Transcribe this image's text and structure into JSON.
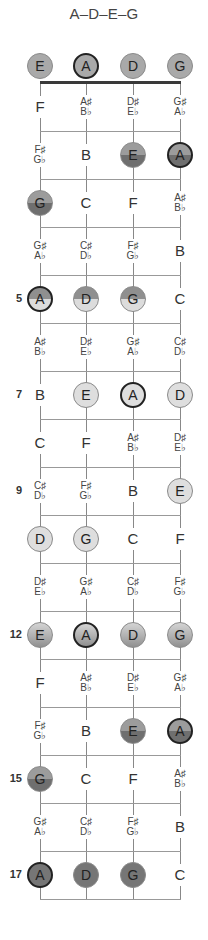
{
  "title": "A–D–E–G",
  "strings": [
    "E",
    "A",
    "D",
    "G"
  ],
  "fret_numbers": [
    {
      "fret": 5,
      "label": "5"
    },
    {
      "fret": 7,
      "label": "7"
    },
    {
      "fret": 9,
      "label": "9"
    },
    {
      "fret": 12,
      "label": "12"
    },
    {
      "fret": 15,
      "label": "15"
    },
    {
      "fret": 17,
      "label": "17"
    }
  ],
  "rows": [
    {
      "fret": 0,
      "cells": [
        {
          "n": "E",
          "s": "open"
        },
        {
          "n": "A",
          "s": "open",
          "root": true
        },
        {
          "n": "D",
          "s": "open"
        },
        {
          "n": "G",
          "s": "open"
        }
      ]
    },
    {
      "fret": 1,
      "cells": [
        {
          "n": "F"
        },
        {
          "n": "A♯|B♭"
        },
        {
          "n": "D♯|E♭"
        },
        {
          "n": "G♯|A♭"
        }
      ]
    },
    {
      "fret": 2,
      "cells": [
        {
          "n": "F♯|G♭"
        },
        {
          "n": "B"
        },
        {
          "n": "E",
          "s": "split-dark"
        },
        {
          "n": "A",
          "s": "split-dark",
          "root": true
        }
      ]
    },
    {
      "fret": 3,
      "cells": [
        {
          "n": "G",
          "s": "split-dark"
        },
        {
          "n": "C"
        },
        {
          "n": "F"
        },
        {
          "n": "A♯|B♭"
        }
      ]
    },
    {
      "fret": 4,
      "cells": [
        {
          "n": "G♯|A♭"
        },
        {
          "n": "C♯|D♭"
        },
        {
          "n": "F♯|G♭"
        },
        {
          "n": "B"
        }
      ]
    },
    {
      "fret": 5,
      "cells": [
        {
          "n": "A",
          "s": "split-light",
          "root": true
        },
        {
          "n": "D",
          "s": "split-light"
        },
        {
          "n": "G",
          "s": "split-light"
        },
        {
          "n": "C"
        }
      ]
    },
    {
      "fret": 6,
      "cells": [
        {
          "n": "A♯|B♭"
        },
        {
          "n": "D♯|E♭"
        },
        {
          "n": "G♯|A♭"
        },
        {
          "n": "C♯|D♭"
        }
      ]
    },
    {
      "fret": 7,
      "cells": [
        {
          "n": "B"
        },
        {
          "n": "E",
          "s": "light"
        },
        {
          "n": "A",
          "s": "light",
          "root": true
        },
        {
          "n": "D",
          "s": "light"
        }
      ]
    },
    {
      "fret": 8,
      "cells": [
        {
          "n": "C"
        },
        {
          "n": "F"
        },
        {
          "n": "A♯|B♭"
        },
        {
          "n": "D♯|E♭"
        }
      ]
    },
    {
      "fret": 9,
      "cells": [
        {
          "n": "C♯|D♭"
        },
        {
          "n": "F♯|G♭"
        },
        {
          "n": "B"
        },
        {
          "n": "E",
          "s": "light"
        }
      ]
    },
    {
      "fret": 10,
      "cells": [
        {
          "n": "D",
          "s": "light"
        },
        {
          "n": "G",
          "s": "light"
        },
        {
          "n": "C"
        },
        {
          "n": "F"
        }
      ]
    },
    {
      "fret": 11,
      "cells": [
        {
          "n": "D♯|E♭"
        },
        {
          "n": "G♯|A♭"
        },
        {
          "n": "C♯|D♭"
        },
        {
          "n": "F♯|G♭"
        }
      ]
    },
    {
      "fret": 12,
      "cells": [
        {
          "n": "E",
          "s": "grad"
        },
        {
          "n": "A",
          "s": "grad",
          "root": true
        },
        {
          "n": "D",
          "s": "grad"
        },
        {
          "n": "G",
          "s": "grad"
        }
      ]
    },
    {
      "fret": 13,
      "cells": [
        {
          "n": "F"
        },
        {
          "n": "A♯|B♭"
        },
        {
          "n": "D♯|E♭"
        },
        {
          "n": "G♯|A♭"
        }
      ]
    },
    {
      "fret": 14,
      "cells": [
        {
          "n": "F♯|G♭"
        },
        {
          "n": "B"
        },
        {
          "n": "E",
          "s": "split-dark"
        },
        {
          "n": "A",
          "s": "split-dark",
          "root": true
        }
      ]
    },
    {
      "fret": 15,
      "cells": [
        {
          "n": "G",
          "s": "split-dark"
        },
        {
          "n": "C"
        },
        {
          "n": "F"
        },
        {
          "n": "A♯|B♭"
        }
      ]
    },
    {
      "fret": 16,
      "cells": [
        {
          "n": "G♯|A♭"
        },
        {
          "n": "C♯|D♭"
        },
        {
          "n": "F♯|G♭"
        },
        {
          "n": "B"
        }
      ]
    },
    {
      "fret": 17,
      "cells": [
        {
          "n": "A",
          "s": "dark",
          "root": true
        },
        {
          "n": "D",
          "s": "dark"
        },
        {
          "n": "G",
          "s": "dark"
        },
        {
          "n": "C"
        }
      ]
    }
  ],
  "colors": {
    "nut": "#3a3a3a",
    "fret": "#999999",
    "string": "#888888",
    "root_border": "#222222"
  }
}
